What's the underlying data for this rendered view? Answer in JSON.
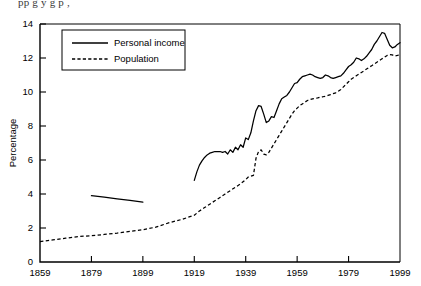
{
  "figure": {
    "truncated_caption": "pp g                        y     g      p    ,",
    "background": "#ffffff",
    "ink_color": "#000000"
  },
  "chart_data": {
    "type": "line",
    "title": "",
    "xlabel": "",
    "ylabel": "Percentage",
    "xlim": [
      1859,
      1999
    ],
    "ylim": [
      0,
      14
    ],
    "ytick_step": 2,
    "xtick_step": 20,
    "grid": false,
    "legend_position": "upper-left-inside",
    "xticks": [
      1859,
      1879,
      1899,
      1919,
      1939,
      1959,
      1979,
      1999
    ],
    "yticks": [
      0,
      2,
      4,
      6,
      8,
      10,
      12,
      14
    ],
    "series": [
      {
        "name": "Personal income",
        "style": "solid",
        "segments": [
          {
            "x": [
              1879,
              1884,
              1889,
              1894,
              1899
            ],
            "y": [
              3.9,
              3.82,
              3.72,
              3.62,
              3.52
            ]
          },
          {
            "x": [
              1919,
              1920,
              1921,
              1922,
              1923,
              1924,
              1925,
              1926,
              1927,
              1928,
              1929,
              1930,
              1931,
              1932,
              1933,
              1934,
              1935,
              1936,
              1937,
              1938,
              1939,
              1940,
              1941,
              1942,
              1943,
              1944,
              1945,
              1946,
              1947,
              1948,
              1949,
              1950,
              1951,
              1952,
              1953,
              1954,
              1955,
              1956,
              1957,
              1958,
              1959,
              1960,
              1961,
              1962,
              1963,
              1964,
              1965,
              1966,
              1967,
              1968,
              1969,
              1970,
              1971,
              1972,
              1973,
              1974,
              1975,
              1976,
              1977,
              1978,
              1979,
              1980,
              1981,
              1982,
              1983,
              1984,
              1985,
              1986,
              1987,
              1988,
              1989,
              1990,
              1991,
              1992,
              1993,
              1994,
              1995,
              1996,
              1997,
              1998,
              1999
            ],
            "y": [
              4.8,
              5.3,
              5.7,
              5.95,
              6.15,
              6.3,
              6.4,
              6.45,
              6.5,
              6.5,
              6.5,
              6.45,
              6.5,
              6.35,
              6.6,
              6.45,
              6.75,
              6.6,
              6.9,
              6.75,
              7.3,
              7.2,
              7.6,
              8.3,
              8.9,
              9.2,
              9.15,
              8.7,
              8.2,
              8.3,
              8.55,
              8.5,
              8.9,
              9.3,
              9.6,
              9.7,
              9.8,
              10.0,
              10.25,
              10.5,
              10.55,
              10.75,
              10.9,
              10.95,
              11.0,
              11.05,
              11.0,
              10.9,
              10.85,
              10.8,
              10.85,
              11.0,
              10.95,
              10.85,
              10.8,
              10.85,
              10.9,
              10.95,
              11.1,
              11.3,
              11.5,
              11.6,
              11.75,
              12.0,
              11.95,
              11.85,
              11.95,
              12.1,
              12.3,
              12.5,
              12.8,
              13.0,
              13.25,
              13.5,
              13.45,
              13.1,
              12.75,
              12.6,
              12.65,
              12.8,
              12.9
            ]
          }
        ]
      },
      {
        "name": "Population",
        "style": "dashed",
        "segments": [
          {
            "x": [
              1859,
              1864,
              1869,
              1874,
              1879,
              1884,
              1889,
              1894,
              1899,
              1904,
              1909,
              1914,
              1919,
              1921,
              1923,
              1925,
              1927,
              1929,
              1931,
              1933,
              1935,
              1937,
              1939,
              1940,
              1941,
              1942,
              1943,
              1944,
              1945,
              1946,
              1947,
              1948,
              1949,
              1950,
              1951,
              1952,
              1953,
              1954,
              1955,
              1956,
              1957,
              1958,
              1959,
              1960,
              1961,
              1962,
              1963,
              1964,
              1965,
              1966,
              1967,
              1968,
              1969,
              1970,
              1971,
              1972,
              1973,
              1974,
              1975,
              1976,
              1977,
              1978,
              1979,
              1980,
              1981,
              1982,
              1983,
              1984,
              1985,
              1986,
              1987,
              1988,
              1989,
              1990,
              1991,
              1992,
              1993,
              1994,
              1995,
              1996,
              1997,
              1998,
              1999
            ],
            "y": [
              1.2,
              1.3,
              1.4,
              1.5,
              1.55,
              1.62,
              1.7,
              1.8,
              1.9,
              2.05,
              2.3,
              2.5,
              2.75,
              3.0,
              3.2,
              3.4,
              3.6,
              3.8,
              4.0,
              4.2,
              4.4,
              4.6,
              4.85,
              5.0,
              5.05,
              5.1,
              6.1,
              6.5,
              6.6,
              6.35,
              6.3,
              6.45,
              6.7,
              6.95,
              7.2,
              7.45,
              7.7,
              7.95,
              8.2,
              8.45,
              8.7,
              8.9,
              9.05,
              9.2,
              9.3,
              9.4,
              9.5,
              9.55,
              9.6,
              9.62,
              9.65,
              9.7,
              9.72,
              9.75,
              9.8,
              9.85,
              9.9,
              9.95,
              10.05,
              10.15,
              10.3,
              10.45,
              10.6,
              10.75,
              10.85,
              10.95,
              11.05,
              11.15,
              11.25,
              11.35,
              11.45,
              11.55,
              11.65,
              11.75,
              11.85,
              11.95,
              12.05,
              12.15,
              12.2,
              12.18,
              12.12,
              12.15,
              12.2
            ]
          }
        ]
      }
    ],
    "legend": [
      {
        "label": "Personal income",
        "style": "solid"
      },
      {
        "label": "Population",
        "style": "dashed"
      }
    ]
  }
}
